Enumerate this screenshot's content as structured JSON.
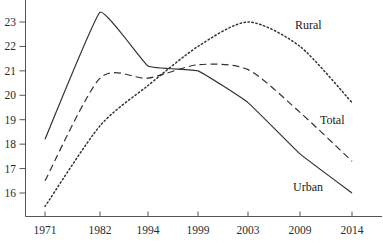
{
  "chart_data": {
    "type": "line",
    "title": "",
    "subtitle": "",
    "xlabel": "",
    "ylabel": "",
    "categories": [
      "1971",
      "1982",
      "1994",
      "1999",
      "2003",
      "2009",
      "2014"
    ],
    "x": [
      1971,
      1982,
      1994,
      1999,
      2003,
      2009,
      2014
    ],
    "xtick_labels": [
      "1971",
      "1982",
      "1994",
      "1999",
      "2003",
      "2009",
      "2014"
    ],
    "ytick_labels": [
      "16",
      "17",
      "18",
      "19",
      "20",
      "21",
      "22",
      "23"
    ],
    "yticks": [
      16,
      17,
      18,
      19,
      20,
      21,
      22,
      23
    ],
    "ylim": [
      15.3,
      23.6
    ],
    "grid": false,
    "legend": "inline-annotations",
    "series": [
      {
        "name": "Urban",
        "style": "solid",
        "color": "#333333",
        "values": [
          18.2,
          23.4,
          21.2,
          21.0,
          19.7,
          17.6,
          16.0
        ],
        "label": "Urban"
      },
      {
        "name": "Total",
        "style": "dashed",
        "color": "#333333",
        "values": [
          16.5,
          20.7,
          20.7,
          21.25,
          21.05,
          19.3,
          17.3
        ],
        "label": "Total"
      },
      {
        "name": "Rural",
        "style": "dotted",
        "color": "#333333",
        "values": [
          15.45,
          18.75,
          20.4,
          22.0,
          23.0,
          22.0,
          19.7
        ],
        "label": "Rural"
      }
    ],
    "annotations": [
      {
        "text": "Rural",
        "x": 295,
        "y": 29
      },
      {
        "text": "Total",
        "x": 320,
        "y": 124
      },
      {
        "text": "Urban",
        "x": 293,
        "y": 191
      }
    ]
  },
  "colors": {
    "axis": "#555555",
    "line": "#333333",
    "text": "#1a1a1a",
    "background": "#ffffff"
  }
}
